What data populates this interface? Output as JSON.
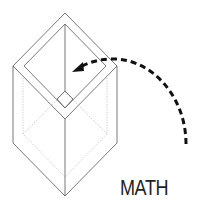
{
  "diagram": {
    "label": "MATH",
    "colors": {
      "outline": "#6a6a6a",
      "hidden_lines": "#b8b8b8",
      "arrow": "#111111",
      "label": "#222222",
      "background": "#ffffff"
    }
  }
}
